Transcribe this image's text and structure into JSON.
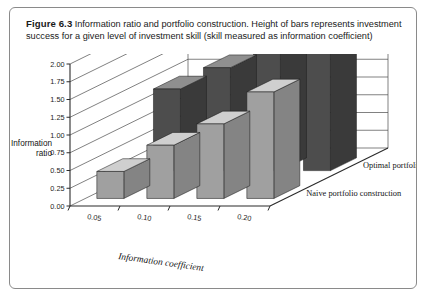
{
  "figure": {
    "number_label": "Figure 6.3",
    "caption": "Information ratio and portfolio construction. Height of bars represents investment success for a given level of investment skill (skill measured as information coefficient)"
  },
  "chart_data": {
    "type": "bar",
    "title": "",
    "subtitle": "",
    "xlabel": "Information coefficient",
    "ylabel": "Information ratio",
    "ylabel_line1": "Information",
    "ylabel_line2": "ratio",
    "categories": [
      "0.05",
      "0.10",
      "0.15",
      "0.20"
    ],
    "series": [
      {
        "name": "Optimal portfolio construction",
        "values": [
          1.15,
          1.45,
          1.72,
          1.95
        ],
        "color": "#4d4d4d",
        "top_color": "#8f8f8f",
        "side_color": "#3a3a3a"
      },
      {
        "name": "Naive portfolio construction",
        "values": [
          0.38,
          0.75,
          1.05,
          1.5
        ],
        "color": "#a0a0a0",
        "top_color": "#cfcfcf",
        "side_color": "#848484"
      }
    ],
    "yticks": [
      "0.00",
      "0.25",
      "0.50",
      "0.75",
      "1.00",
      "1.25",
      "1.50",
      "1.75",
      "2.00"
    ],
    "ytick_values": [
      0.0,
      0.25,
      0.5,
      0.75,
      1.0,
      1.25,
      1.5,
      1.75,
      2.0
    ],
    "ylim": [
      0.0,
      2.0
    ],
    "grid": true,
    "legend_position": "depth-axis",
    "projection": "3d"
  }
}
